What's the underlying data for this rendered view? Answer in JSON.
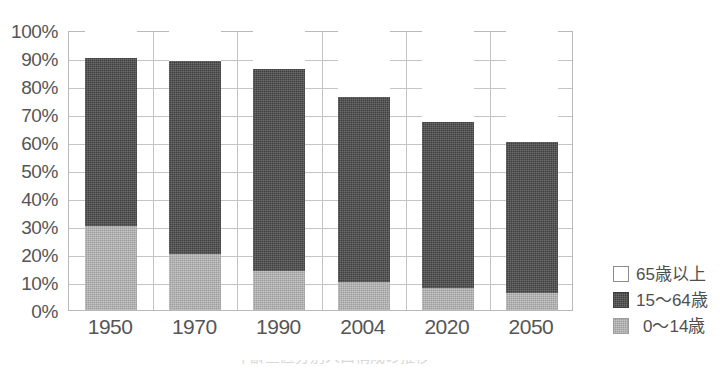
{
  "chart_data": {
    "type": "bar",
    "subtype": "stacked-percentage",
    "title": "",
    "xlabel": "",
    "ylabel": "",
    "categories": [
      "1950",
      "1970",
      "1990",
      "2004",
      "2020",
      "2050"
    ],
    "series": [
      {
        "name": "0〜14歳",
        "key": "young",
        "color": "#9d9d9d",
        "values": [
          30,
          20,
          14,
          10,
          8,
          6
        ]
      },
      {
        "name": "15〜64歳",
        "key": "working",
        "color": "#3f3f3f",
        "values": [
          60,
          69,
          72,
          66,
          59,
          54
        ]
      },
      {
        "name": "65歳以上",
        "key": "old",
        "color": "#ffffff",
        "values": [
          10,
          11,
          14,
          24,
          33,
          40
        ]
      }
    ],
    "cumulative_tops": {
      "young": [
        30,
        20,
        14,
        10,
        8,
        6
      ],
      "working": [
        90,
        89,
        86,
        76,
        67,
        60
      ],
      "old": [
        100,
        100,
        100,
        100,
        100,
        100
      ]
    },
    "ylim": [
      0,
      100
    ],
    "y_ticks": [
      "0%",
      "10%",
      "20%",
      "30%",
      "40%",
      "50%",
      "60%",
      "70%",
      "80%",
      "90%",
      "100%"
    ],
    "y_tick_values": [
      0,
      10,
      20,
      30,
      40,
      50,
      60,
      70,
      80,
      90,
      100
    ],
    "grid": {
      "horizontal": true,
      "vertical": true
    },
    "legend": {
      "position": "right",
      "entries": [
        {
          "label": "65歳以上",
          "swatch": "white"
        },
        {
          "label": "15〜64歳",
          "swatch": "dark-gray"
        },
        {
          "label": "0〜14歳",
          "swatch": "light-gray"
        }
      ]
    }
  },
  "axis": {
    "y_labels": [
      "100%",
      "90%",
      "80%",
      "70%",
      "60%",
      "50%",
      "40%",
      "30%",
      "20%",
      "10%",
      "0%"
    ],
    "x_labels": [
      "1950",
      "1970",
      "1990",
      "2004",
      "2020",
      "2050"
    ]
  },
  "legend": {
    "items": [
      {
        "label": "65歳以上"
      },
      {
        "label": "15〜64歳"
      },
      {
        "label": "0〜14歳"
      }
    ]
  },
  "caption": {
    "text": "年齢三区分別人口構成の推移"
  },
  "colors": {
    "young": "#9d9d9d",
    "working": "#3f3f3f",
    "old": "#ffffff",
    "grid": "#c4c4c4",
    "axis_border": "#b9b9b9",
    "text": "#555555"
  }
}
